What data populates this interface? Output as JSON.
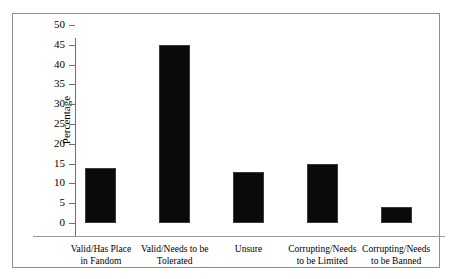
{
  "figure": {
    "background_color": "#ffffff",
    "frame_color": "#8d8d8d",
    "bar_color": "#0a0a0a"
  },
  "chart_data": {
    "type": "bar",
    "title": "",
    "xlabel": "",
    "ylabel": "Percentage",
    "ylim": [
      0,
      50
    ],
    "ytick_step": 5,
    "grid": false,
    "legend": false,
    "categories": [
      "Valid/Has Place in Fandom",
      "Valid/Needs to be Tolerated",
      "Unsure",
      "Corrupting/Needs to be Limited",
      "Corrupting/Needs to be Banned"
    ],
    "category_lines": [
      [
        "Valid/Has Place",
        "in Fandom"
      ],
      [
        "Valid/Needs to be",
        "Tolerated"
      ],
      [
        "Unsure",
        ""
      ],
      [
        "Corrupting/Needs",
        "to be Limited"
      ],
      [
        "Corrupting/Needs",
        "to be Banned"
      ]
    ],
    "values": [
      14,
      45,
      13,
      15,
      4
    ],
    "ytick_labels": [
      "0",
      "5",
      "10",
      "15",
      "20",
      "25",
      "30",
      "35",
      "40",
      "45",
      "50"
    ],
    "ytick_values": [
      0,
      5,
      10,
      15,
      20,
      25,
      30,
      35,
      40,
      45,
      50
    ]
  }
}
